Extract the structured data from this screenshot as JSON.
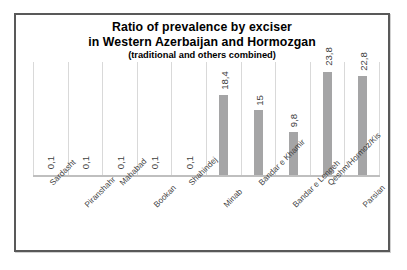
{
  "chart_data": {
    "type": "bar",
    "title": "Ratio  of prevalence by exciser in Western Azerbaijan and Hormozgan (traditional and others combined)",
    "title_line1": "Ratio  of prevalence by exciser",
    "title_line2": "in Western Azerbaijan and Hormozgan",
    "title_line3": "(traditional and others combined)",
    "xlabel": "",
    "ylabel": "",
    "ylim": [
      0,
      26
    ],
    "grid": "vertical-category-separators",
    "legend": "none",
    "categories": [
      "Sardasht",
      "Piranshahr",
      "Mahabad",
      "Bookan",
      "Shahindej",
      "Minab",
      "Bandar e Khamir",
      "Bandar e Lengeh",
      "Qeshm/Hormoz/Kis",
      "Parsian"
    ],
    "values": [
      0.1,
      0.1,
      0.1,
      0.1,
      0.1,
      18.4,
      15,
      9.8,
      23.8,
      22.8
    ],
    "value_labels": [
      "0,1",
      "0,1",
      "0,1",
      "0,1",
      "0,1",
      "18,4",
      "15",
      "9,8",
      "23,8",
      "22,8"
    ],
    "bar_color": "#a5a5a6",
    "frame_color": "#595959",
    "gridline_color": "#d9d9d9",
    "label_color": "#3f3f3f",
    "label_rotation_deg": 90,
    "category_label_rotation_deg": -45
  }
}
